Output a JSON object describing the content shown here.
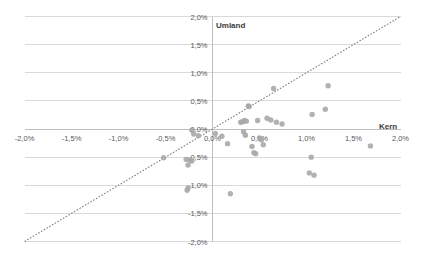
{
  "chart_data": {
    "type": "scatter",
    "title": "",
    "subtitle": "",
    "xlabel": "Kern",
    "ylabel": "Umland",
    "xlim": [
      -2.0,
      2.0
    ],
    "ylim": [
      -2.0,
      2.0
    ],
    "grid": true,
    "legend": null,
    "legend_position": "none",
    "xtick_labels": [
      "-2,0%",
      "-1,5%",
      "-1,0%",
      "-0,5%",
      "0,0%",
      "0,5%",
      "1,0%",
      "1,5%",
      "2,0%"
    ],
    "xtick_values": [
      -2.0,
      -1.5,
      -1.0,
      -0.5,
      0.0,
      0.5,
      1.0,
      1.5,
      2.0
    ],
    "ytick_labels": [
      "2,0%",
      "1,5%",
      "1,0%",
      "0,5%",
      "0,0%",
      "-0,5%",
      "-1,0%",
      "-1,5%",
      "-2,0%"
    ],
    "ytick_values": [
      2.0,
      1.5,
      1.0,
      0.5,
      0.0,
      -0.5,
      -1.0,
      -1.5,
      -2.0
    ],
    "annotations": [
      {
        "text": "Umland",
        "role": "y-axis-title",
        "x": 0.05,
        "y": 1.85
      },
      {
        "text": "Kern",
        "role": "x-axis-title",
        "x": 1.82,
        "y": 0.07
      }
    ],
    "reference_line": {
      "type": "identity",
      "style": "dotted",
      "color": "#7f7f7f",
      "from": [
        -2.0,
        -2.0
      ],
      "to": [
        2.0,
        2.0
      ]
    },
    "marker": {
      "shape": "circle",
      "color": "#a9a9a9",
      "size_px": 5.4,
      "opacity": 0.9
    },
    "series": [
      {
        "name": "Gemeinden",
        "color": "#a9a9a9",
        "points": [
          {
            "x": -0.22,
            "y": -0.02
          },
          {
            "x": -0.2,
            "y": -0.09
          },
          {
            "x": -0.15,
            "y": -0.12
          },
          {
            "x": -0.52,
            "y": -0.51
          },
          {
            "x": -0.28,
            "y": -0.54
          },
          {
            "x": -0.26,
            "y": -0.64
          },
          {
            "x": -0.24,
            "y": -0.55
          },
          {
            "x": -0.22,
            "y": -0.57
          },
          {
            "x": -0.26,
            "y": -1.05
          },
          {
            "x": -0.27,
            "y": -1.09
          },
          {
            "x": 0.03,
            "y": -0.08
          },
          {
            "x": 0.1,
            "y": -0.13
          },
          {
            "x": 0.16,
            "y": -0.26
          },
          {
            "x": 0.19,
            "y": -1.15
          },
          {
            "x": 0.3,
            "y": 0.12
          },
          {
            "x": 0.32,
            "y": 0.13
          },
          {
            "x": 0.34,
            "y": 0.15
          },
          {
            "x": 0.36,
            "y": 0.14
          },
          {
            "x": 0.33,
            "y": -0.05
          },
          {
            "x": 0.35,
            "y": -0.11
          },
          {
            "x": 0.38,
            "y": 0.41
          },
          {
            "x": 0.39,
            "y": 0.4
          },
          {
            "x": 0.42,
            "y": -0.31
          },
          {
            "x": 0.44,
            "y": -0.42
          },
          {
            "x": 0.46,
            "y": -0.44
          },
          {
            "x": 0.48,
            "y": 0.15
          },
          {
            "x": 0.5,
            "y": -0.16
          },
          {
            "x": 0.52,
            "y": -0.19
          },
          {
            "x": 0.54,
            "y": -0.28
          },
          {
            "x": 0.58,
            "y": 0.19
          },
          {
            "x": 0.62,
            "y": 0.16
          },
          {
            "x": 0.65,
            "y": 0.72
          },
          {
            "x": 0.68,
            "y": 0.12
          },
          {
            "x": 0.74,
            "y": 0.09
          },
          {
            "x": 1.03,
            "y": -0.78
          },
          {
            "x": 1.05,
            "y": -0.5
          },
          {
            "x": 1.06,
            "y": 0.26
          },
          {
            "x": 1.08,
            "y": -0.82
          },
          {
            "x": 1.2,
            "y": 0.35
          },
          {
            "x": 1.23,
            "y": 0.77
          },
          {
            "x": 1.68,
            "y": -0.3
          }
        ]
      }
    ]
  },
  "labels": {
    "y_axis_title": "Umland",
    "x_axis_title": "Kern"
  }
}
